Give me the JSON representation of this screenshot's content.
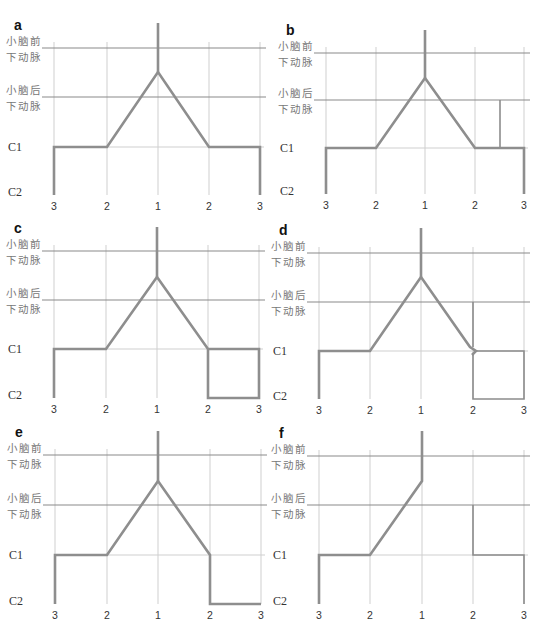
{
  "figure": {
    "level_labels": {
      "aica_line1": "小脑前",
      "aica_line2": "下动脉",
      "pica_line1": "小脑后",
      "pica_line2": "下动脉",
      "c1": "C1",
      "c2": "C2"
    },
    "x_ticks": [
      "3",
      "2",
      "1",
      "2",
      "3"
    ],
    "colors": {
      "vessel": "#8e8e8e",
      "grid": "#cfcfcf",
      "level_line": "#8a8a8a",
      "text": "#333333"
    },
    "panels": [
      {
        "id": "a",
        "letter": "a",
        "x": [
          54,
          107,
          158,
          209,
          260
        ],
        "y": {
          "aica": 48,
          "pica": 97,
          "c1": 147,
          "c2": 195
        },
        "stem_top": 23,
        "apex": 72,
        "thick_paths": [
          "M54,195 L54,147 L107,147 L158,72 L209,147 L260,147 L260,195",
          "M158,23 L158,72"
        ],
        "thin_paths": [],
        "gap_c1_mid": false
      },
      {
        "id": "b",
        "letter": "b",
        "x": [
          326,
          376,
          425,
          475,
          524
        ],
        "y": {
          "aica": 53,
          "pica": 100,
          "c1": 148,
          "c2": 194
        },
        "stem_top": 30,
        "apex": 78,
        "thick_paths": [
          "M326,194 L326,148 L376,148 L425,78 L475,148 L524,148 L524,194",
          "M425,30 L425,78"
        ],
        "thin_paths": [
          "M500,148 L500,100"
        ],
        "gap_c1_mid": false
      },
      {
        "id": "c",
        "letter": "c",
        "x": [
          54,
          106,
          157,
          208,
          259
        ],
        "y": {
          "aica": 251,
          "pica": 300,
          "c1": 349,
          "c2": 398
        },
        "stem_top": 227,
        "apex": 277,
        "thick_paths": [
          "M54,398 L54,349 L106,349 L157,277 L208,349 L259,349 L259,398 L208,398 L208,349",
          "M157,227 L157,277"
        ],
        "thin_paths": [],
        "gap_c1_mid": false
      },
      {
        "id": "d",
        "letter": "d",
        "x": [
          319,
          370,
          421,
          473,
          524
        ],
        "y": {
          "aica": 253,
          "pica": 302,
          "c1": 351,
          "c2": 399
        },
        "stem_top": 228,
        "apex": 277,
        "thick_paths": [
          "M319,399 L319,351 L370,351 L421,277 L470,347 L476,351 L472,355",
          "M421,228 L421,277"
        ],
        "thin_paths": [
          "M473,302 L473,347",
          "M473,355 L473,399 L524,399 L524,351 L476,351"
        ],
        "gap_c1_mid": false
      },
      {
        "id": "e",
        "letter": "e",
        "x": [
          55,
          107,
          158,
          210,
          261
        ],
        "y": {
          "aica": 455,
          "pica": 505,
          "c1": 555,
          "c2": 604
        },
        "stem_top": 431,
        "apex": 481,
        "thick_paths": [
          "M55,604 L55,555 L107,555 L158,481 L210,555 L210,604 L261,604",
          "M158,431 L158,481"
        ],
        "thin_paths": [],
        "gap_c1_mid": false
      },
      {
        "id": "f",
        "letter": "f",
        "x": [
          319,
          370,
          422,
          473,
          524
        ],
        "y": {
          "aica": 456,
          "pica": 505,
          "c1": 555,
          "c2": 604
        },
        "stem_top": 431,
        "apex": 481,
        "thick_paths": [
          "M319,604 L319,555 L370,555 L422,481 L422,431"
        ],
        "thin_paths": [
          "M473,505 L473,555 L524,555 L524,604"
        ],
        "gap_c1_mid": false
      }
    ]
  }
}
